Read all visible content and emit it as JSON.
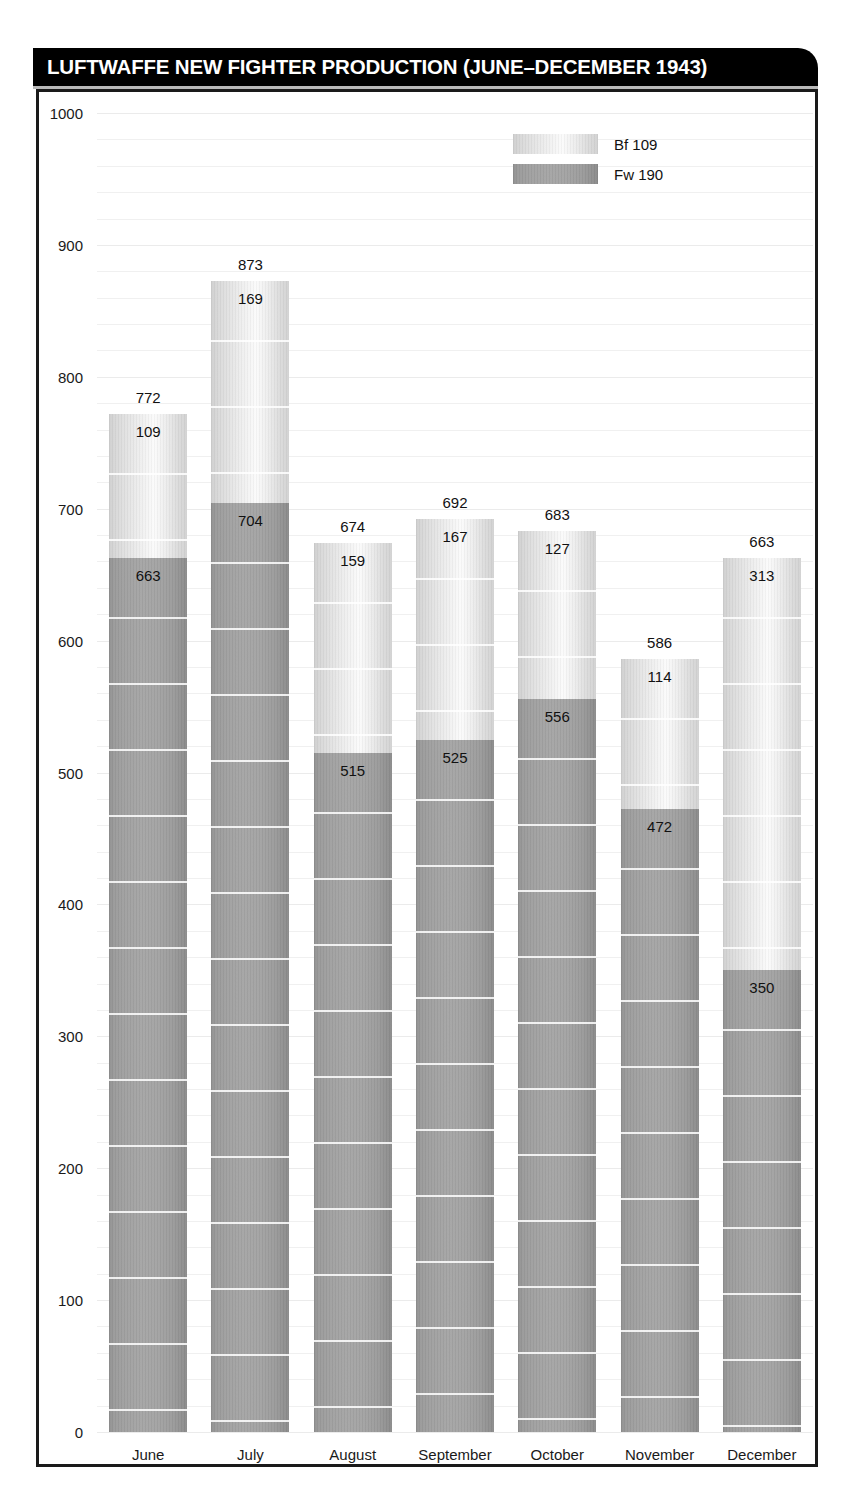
{
  "header": {
    "title": "LUFTWAFFE NEW FIGHTER PRODUCTION (JUNE–DECEMBER 1943)"
  },
  "legend": {
    "items": [
      {
        "label": "Bf 109",
        "swatch": "light-gradient-swatch",
        "color": "#e2e2e2"
      },
      {
        "label": "Fw 190",
        "swatch": "dark-gradient-swatch",
        "color": "#9d9d9d"
      }
    ]
  },
  "axis": {
    "y_ticks": [
      "0",
      "100",
      "200",
      "300",
      "400",
      "500",
      "600",
      "700",
      "800",
      "900",
      "1000"
    ],
    "x_ticks": [
      "June",
      "July",
      "August",
      "September",
      "October",
      "November",
      "December"
    ]
  },
  "chart_data": {
    "type": "bar",
    "stacked": true,
    "title": "LUFTWAFFE NEW FIGHTER PRODUCTION (JUNE–DECEMBER 1943)",
    "xlabel": "",
    "ylabel": "",
    "ylim": [
      0,
      1000
    ],
    "ytick_interval": 100,
    "grid": true,
    "legend_position": "top-center-right",
    "categories": [
      "June",
      "July",
      "August",
      "September",
      "October",
      "November",
      "December"
    ],
    "series": [
      {
        "name": "Fw 190",
        "color": "#9d9d9d",
        "values": [
          663,
          704,
          515,
          525,
          556,
          472,
          350
        ]
      },
      {
        "name": "Bf 109",
        "color": "#e2e2e2",
        "values": [
          109,
          169,
          159,
          167,
          127,
          114,
          313
        ]
      }
    ],
    "totals": [
      772,
      873,
      674,
      692,
      683,
      586,
      663
    ],
    "bars": [
      {
        "category": "June",
        "fw190": 663,
        "bf109": 109,
        "total": 772
      },
      {
        "category": "July",
        "fw190": 704,
        "bf109": 169,
        "total": 873
      },
      {
        "category": "August",
        "fw190": 515,
        "bf109": 159,
        "total": 674
      },
      {
        "category": "September",
        "fw190": 525,
        "bf109": 167,
        "total": 692
      },
      {
        "category": "October",
        "fw190": 556,
        "bf109": 127,
        "total": 683
      },
      {
        "category": "November",
        "fw190": 472,
        "bf109": 114,
        "total": 586
      },
      {
        "category": "December",
        "fw190": 350,
        "bf109": 313,
        "total": 663
      }
    ]
  }
}
